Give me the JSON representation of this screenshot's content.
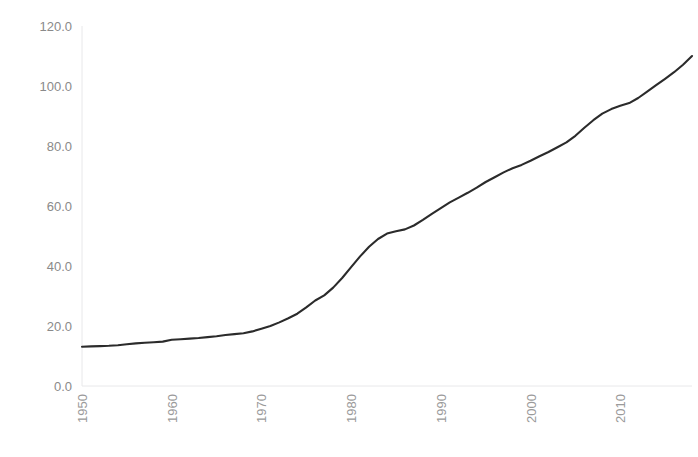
{
  "chart_data": {
    "type": "line",
    "title": "",
    "subtitle": "",
    "xlabel": "",
    "ylabel": "",
    "xlim": [
      1950,
      2018
    ],
    "ylim": [
      0,
      120
    ],
    "grid": false,
    "legend": "none",
    "line_color": "#2b2b2b",
    "axis_color": "#e8e8ea",
    "tick_label_color": "#8a8a8a",
    "x_tick_labels": [
      "1950",
      "1960",
      "1970",
      "1980",
      "1990",
      "2000",
      "2010"
    ],
    "x_ticks": [
      1950,
      1960,
      1970,
      1980,
      1990,
      2000,
      2010
    ],
    "x_tick_rotation": -90,
    "y_tick_labels": [
      "0.0",
      "20.0",
      "40.0",
      "60.0",
      "80.0",
      "100.0",
      "120.0"
    ],
    "y_ticks": [
      0,
      20,
      40,
      60,
      80,
      100,
      120
    ],
    "series": [
      {
        "name": "series-1",
        "x": [
          1950,
          1951,
          1952,
          1953,
          1954,
          1955,
          1956,
          1957,
          1958,
          1959,
          1960,
          1961,
          1962,
          1963,
          1964,
          1965,
          1966,
          1967,
          1968,
          1969,
          1970,
          1971,
          1972,
          1973,
          1974,
          1975,
          1976,
          1977,
          1978,
          1979,
          1980,
          1981,
          1982,
          1983,
          1984,
          1985,
          1986,
          1987,
          1988,
          1989,
          1990,
          1991,
          1992,
          1993,
          1994,
          1995,
          1996,
          1997,
          1998,
          1999,
          2000,
          2001,
          2002,
          2003,
          2004,
          2005,
          2006,
          2007,
          2008,
          2009,
          2010,
          2011,
          2012,
          2013,
          2014,
          2015,
          2016,
          2017,
          2018
        ],
        "values": [
          13.1,
          13.2,
          13.3,
          13.4,
          13.6,
          13.9,
          14.2,
          14.4,
          14.6,
          14.8,
          15.4,
          15.6,
          15.8,
          16.0,
          16.3,
          16.6,
          17.0,
          17.3,
          17.6,
          18.2,
          19.1,
          20.0,
          21.2,
          22.6,
          24.1,
          26.2,
          28.5,
          30.2,
          32.8,
          36.0,
          39.6,
          43.2,
          46.4,
          49.0,
          50.8,
          51.6,
          52.2,
          53.5,
          55.4,
          57.4,
          59.3,
          61.2,
          62.8,
          64.4,
          66.1,
          68.0,
          69.6,
          71.2,
          72.6,
          73.7,
          75.1,
          76.6,
          78.0,
          79.6,
          81.2,
          83.4,
          86.1,
          88.6,
          90.8,
          92.3,
          93.4,
          94.3,
          96.0,
          98.1,
          100.3,
          102.4,
          104.6,
          107.1,
          110.0
        ]
      }
    ]
  }
}
